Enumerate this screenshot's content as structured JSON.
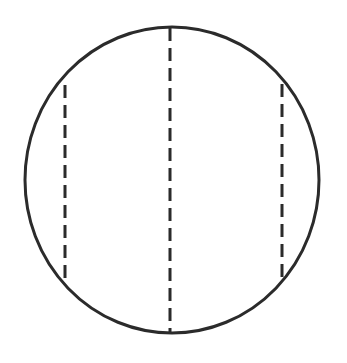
{
  "figure": {
    "type": "geometric-line-drawing",
    "background_color": "#ffffff",
    "stroke_color": "#2b2b2b",
    "canvas": {
      "width": 347,
      "height": 363
    },
    "labels": [],
    "text": []
  },
  "shapes": {
    "circle": {
      "name": "circle-outline",
      "style": "solid",
      "cx": 172,
      "cy": 180,
      "rx": 147,
      "ry": 153,
      "stroke_width": 3,
      "stroke_color": "#2b2b2b",
      "fill": "none"
    },
    "chords": [
      {
        "name": "left-chord",
        "style": "dashed",
        "x": 65,
        "y1": 85,
        "y2": 282,
        "stroke_width": 3,
        "stroke_color": "#2b2b2b",
        "dash": "13 7"
      },
      {
        "name": "center-diameter",
        "style": "dashed",
        "x": 170,
        "y1": 28,
        "y2": 332,
        "stroke_width": 3,
        "stroke_color": "#2b2b2b",
        "dash": "13 7"
      },
      {
        "name": "right-chord",
        "style": "dashed",
        "x": 282,
        "y1": 84,
        "y2": 281,
        "stroke_width": 3,
        "stroke_color": "#2b2b2b",
        "dash": "13 7"
      }
    ]
  }
}
